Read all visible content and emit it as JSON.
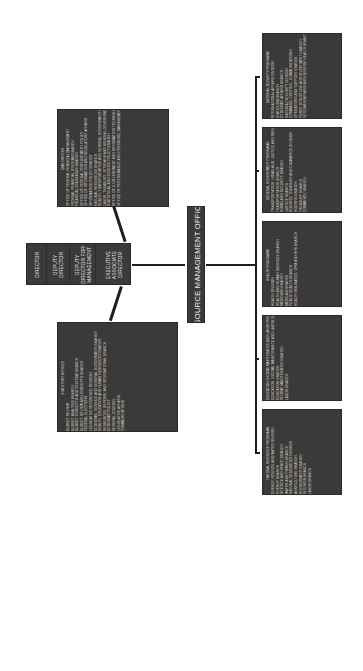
{
  "director_box": {
    "rows": [
      "DIRECTOR",
      "DEPUTY DIRECTOR",
      "DEPUTY DIRECTOR FOR MANAGEMENT",
      "EXECUTIVE ASSOCIATE DIRECTOR"
    ]
  },
  "center_box": {
    "title": "RESOURCE MANAGEMENT OFFICES"
  },
  "upper_box": {
    "heading": "OMB OFFICES",
    "lines": [
      "OFFICE OF FEDERAL FINANCIAL MANAGEMENT",
      "FEDERAL FINANCIAL SYSTEMS BRANCH",
      "FINANCIAL STANDARDS BRANCH",
      "OFFICE OF FEDERAL PROCUREMENT POLICY",
      "OFFICE OF INFORMATION AND REGULATORY AFFAIRS",
      "INFORMATION POLICY BRANCH",
      "NATURAL RESOURCES BRANCH",
      "HEALTH, TRANSPORTATION AND GENERAL GOVERNMENT BRANCH",
      "LABOR, TREASURY, VETERANS AND GENERAL GOVERNMENT BRANCH",
      "STATISTICAL AND SCIENCE POLICY BRANCH",
      "OFFICE OF E-GOVERNMENT AND INFORMATION TECHNOLOGY",
      "OFFICE OF PERFORMANCE AND PERSONNEL MANAGEMENT"
    ]
  },
  "lower_box": {
    "heading": "STATUTORY OFFICES",
    "lines": [
      "BUDGET REVIEW",
      "BUDGET ANALYSIS BRANCH",
      "BUDGET CONCEPTS AND SYSTEMS BRANCH",
      "BUDGET REVIEW AND CONCEPTS BRANCH",
      "FEDERAL ELECTIONS",
      "LEGISLATIVE REFERENCE DIVISION",
      "ECONOMIC, SCIENCE AND GENERAL GOVERNMENT BRANCH",
      "HEALTH, EDUCATION AND HUMAN RESOURCES BRANCH",
      "RESOURCES, DEFENSE AND INTERNATIONAL BRANCH",
      "ECONOMIC POLICY",
      "GENERAL COUNSEL",
      "LEGISLATIVE AFFAIRS",
      "COMMUNICATIONS"
    ]
  },
  "program_boxes": [
    {
      "heading": "NATIONAL SECURITY PROGRAMS",
      "lines": [
        "INTERNATIONAL AFFAIRS DIVISION",
        "STATE/USIA BRANCH",
        "ECONOMIC AFFAIRS BRANCH",
        "NATIONAL SECURITY DIVISION",
        "COMMAND, CONTROL, COMMUNICATIONS",
        "OPERATIONS AND SUPPORT BRANCH",
        "FORCE STRUCTURE AND INVESTMENT BRANCH",
        "VETERANS AFFAIRS AND DEFENSE HEALTH BRANCH"
      ]
    },
    {
      "heading": "GENERAL GOVERNMENT PROGRAMS",
      "lines": [
        "TRANSPORTATION, HOMELAND, JUSTICE AND SERVICES DIVISION",
        "TRANSPORTATION BRANCH",
        "HOMELAND SECURITY BRANCH",
        "JUSTICE BRANCH",
        "HOUSING, TREASURY AND COMMERCE DIVISION",
        "HOUSING BRANCH",
        "TREASURY BRANCH",
        "COMMERCE BRANCH"
      ]
    },
    {
      "heading": "HEALTH PROGRAMS",
      "lines": [
        "HEALTH DIVISION",
        "HEALTH AND HUMAN SERVICES BRANCH",
        "MEDICARE BRANCH",
        "MEDICAID BRANCH",
        "PUBLIC HEALTH BRANCH",
        "HEALTH INSURANCE, OPM AND HHS BRANCH"
      ]
    },
    {
      "heading": "EDUCATION, INCOME MAINTENANCE AND LABOR PROGRAMS",
      "lines": [
        "EDUCATION, INCOME MAINTENANCE AND LABOR DIVISION",
        "EDUCATION BRANCH",
        "INCOME MAINTENANCE BRANCH",
        "LABOR BRANCH"
      ]
    },
    {
      "heading": "NATURAL RESOURCE PROGRAMS",
      "lines": [
        "ENERGY, SCIENCE AND WATER DIVISION",
        "ENERGY BRANCH",
        "SCIENCE AND SPACE BRANCH",
        "WATER AND POWER BRANCH",
        "NATURAL RESOURCES DIVISION",
        "AGRICULTURE BRANCH",
        "ENVIRONMENT BRANCH",
        "INTERIOR BRANCH",
        "LANDS BRANCH"
      ]
    }
  ]
}
